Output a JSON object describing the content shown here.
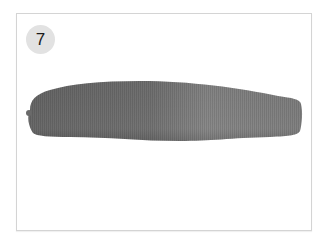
{
  "figure": {
    "step_number": "7",
    "colors": {
      "frame_border": "#d4d4d4",
      "badge_bg": "#e2e2e2",
      "badge_text": "#1a1a1a",
      "fabric_dark": "#6e6e6e",
      "fabric_light": "#8c8c8c"
    }
  }
}
